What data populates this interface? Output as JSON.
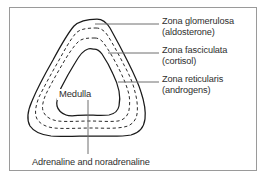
{
  "figure": {
    "background_color": "#ffffff",
    "frame_color": "#9a9a9a",
    "text_color": "#2e2e2e",
    "contour_color": "#1a1a1a",
    "leader_color": "#6e6e6e"
  },
  "labels": {
    "glomerulosa": {
      "name": "Zona glomerulosa",
      "hormone": "(aldosterone)"
    },
    "fasciculata": {
      "name": "Zona fasciculata",
      "hormone": "(cortisol)"
    },
    "reticularis": {
      "name": "Zona reticularis",
      "hormone": "(androgens)"
    },
    "medulla": {
      "name": "Medulla"
    },
    "caption": {
      "text": "Adrenaline and noradrenaline"
    }
  },
  "diagram_data": {
    "type": "cross-section-contours",
    "layer_count": 4,
    "layers": [
      {
        "id": "zona-glomerulosa",
        "style": "solid",
        "position": "outermost"
      },
      {
        "id": "zona-fasciculata",
        "style": "dashed",
        "position": "second"
      },
      {
        "id": "zona-reticularis",
        "style": "dashed",
        "position": "third"
      },
      {
        "id": "medulla",
        "style": "solid",
        "position": "innermost"
      }
    ],
    "leader_lines": [
      {
        "from": "zona-glomerulosa",
        "to": "label-glomerulosa",
        "direction": "right"
      },
      {
        "from": "zona-fasciculata",
        "to": "label-fasciculata",
        "direction": "right"
      },
      {
        "from": "zona-reticularis",
        "to": "label-reticularis",
        "direction": "right"
      },
      {
        "from": "medulla",
        "to": "label-caption",
        "direction": "down"
      }
    ]
  }
}
